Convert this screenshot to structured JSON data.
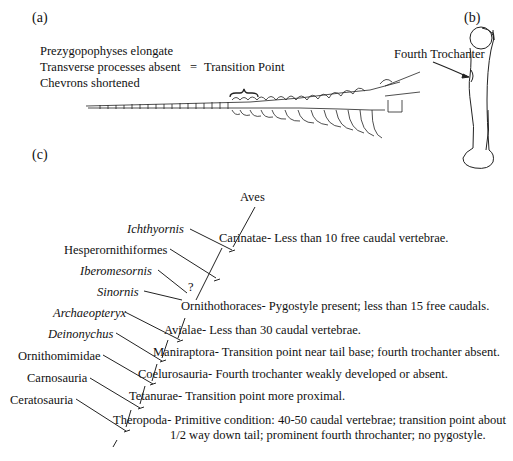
{
  "panel_a": {
    "label": "(a)",
    "features": [
      "Prezygopophyses elongate",
      "Transverse processes absent",
      "Chevrons shortened"
    ],
    "equals": "=",
    "result": "Transition Point"
  },
  "panel_b": {
    "label": "(b)",
    "annotation": "Fourth Trochanter"
  },
  "panel_c": {
    "label": "(c)",
    "taxa": [
      {
        "name": "Ichthyornis",
        "italic": true
      },
      {
        "name": "Hesperornithiformes",
        "italic": false
      },
      {
        "name": "Iberomesornis",
        "italic": true
      },
      {
        "name": "Sinornis",
        "italic": true
      },
      {
        "name": "Archaeopteryx",
        "italic": true
      },
      {
        "name": "Deinonychus",
        "italic": true
      },
      {
        "name": "Ornithomimidae",
        "italic": false
      },
      {
        "name": "Carnosauria",
        "italic": false
      },
      {
        "name": "Ceratosauria",
        "italic": false
      }
    ],
    "nodes": [
      {
        "name": "Aves",
        "desc": ""
      },
      {
        "name": "Carinatae-",
        "desc": "Less than 10 free caudal vertebrae."
      },
      {
        "name": "?",
        "desc": ""
      },
      {
        "name": "Ornithothoraces-",
        "desc": "Pygostyle present; less than 15 free caudals."
      },
      {
        "name": "Avialae-",
        "desc": "Less than 30 caudal vertebrae."
      },
      {
        "name": "Maniraptora-",
        "desc": "Transition point near tail base; fourth trochanter absent."
      },
      {
        "name": "Coelurosauria-",
        "desc": "Fourth trochanter weakly developed or absent."
      },
      {
        "name": "Tetanurae-",
        "desc": "Transition point more proximal."
      },
      {
        "name": "Theropoda-",
        "desc": "Primitive condition: 40-50 caudal vertebrae; transition point about",
        "desc2": "1/2 way down tail; prominent fourth throchanter; no pygostyle."
      }
    ]
  }
}
